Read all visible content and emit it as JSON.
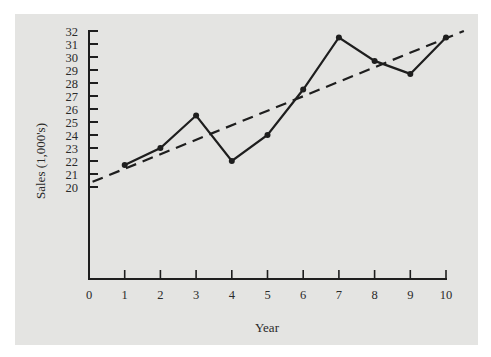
{
  "chart_data": {
    "type": "line",
    "title": "",
    "xlabel": "Year",
    "ylabel": "Sales (1,000's)",
    "x": [
      1,
      2,
      3,
      4,
      5,
      6,
      7,
      8,
      9,
      10
    ],
    "series": [
      {
        "name": "Sales",
        "style": "solid-with-markers",
        "values": [
          21.7,
          23.0,
          25.5,
          22.0,
          24.0,
          27.5,
          31.5,
          29.7,
          28.7,
          31.5
        ]
      },
      {
        "name": "Trend",
        "style": "dashed",
        "points": [
          [
            0.1,
            20.4
          ],
          [
            10.5,
            32.0
          ]
        ]
      }
    ],
    "xticks": [
      0,
      1,
      2,
      3,
      4,
      5,
      6,
      7,
      8,
      9,
      10
    ],
    "yticks": [
      20,
      21,
      22,
      23,
      24,
      25,
      26,
      27,
      28,
      29,
      30,
      31,
      32
    ],
    "xlim": [
      0,
      10
    ],
    "ylim": [
      20,
      32
    ],
    "grid": false,
    "legend": "none",
    "colors": {
      "background": "#e4e4e2",
      "line": "#1e1e1e",
      "axis": "#1e1e1e"
    }
  },
  "labels": {
    "xlabel": "Year",
    "ylabel": "Sales (1,000's)"
  }
}
